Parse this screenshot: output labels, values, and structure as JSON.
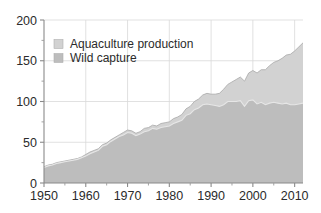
{
  "chart_data": {
    "type": "area",
    "title": "",
    "subtitle": "",
    "xlabel": "",
    "ylabel": "",
    "xlim": [
      1950,
      2012
    ],
    "ylim": [
      0,
      200
    ],
    "grid": true,
    "stacked": true,
    "legend_position": "top-left",
    "x": [
      1950,
      1951,
      1952,
      1953,
      1954,
      1955,
      1956,
      1957,
      1958,
      1959,
      1960,
      1961,
      1962,
      1963,
      1964,
      1965,
      1966,
      1967,
      1968,
      1969,
      1970,
      1971,
      1972,
      1973,
      1974,
      1975,
      1976,
      1977,
      1978,
      1979,
      1980,
      1981,
      1982,
      1983,
      1984,
      1985,
      1986,
      1987,
      1988,
      1989,
      1990,
      1991,
      1992,
      1993,
      1994,
      1995,
      1996,
      1997,
      1998,
      1999,
      2000,
      2001,
      2002,
      2003,
      2004,
      2005,
      2006,
      2007,
      2008,
      2009,
      2010,
      2011,
      2012
    ],
    "xticks": [
      1950,
      1960,
      1970,
      1980,
      1990,
      2000,
      2010
    ],
    "yticks": [
      0,
      50,
      100,
      150,
      200
    ],
    "yticks_minor": [
      25,
      75,
      125,
      175
    ],
    "series": [
      {
        "name": "Wild capture",
        "color": "#bdbdbd",
        "values": [
          19,
          21,
          22,
          24,
          25,
          26,
          27,
          28,
          29,
          31,
          33,
          36,
          38,
          40,
          45,
          47,
          51,
          54,
          57,
          59,
          62,
          61,
          58,
          60,
          63,
          64,
          67,
          66,
          68,
          69,
          70,
          73,
          75,
          77,
          83,
          85,
          90,
          92,
          96,
          97,
          96,
          95,
          94,
          96,
          100,
          100,
          100,
          101,
          94,
          101,
          102,
          97,
          99,
          96,
          98,
          99,
          98,
          97,
          98,
          96,
          96,
          97,
          98
        ]
      },
      {
        "name": "Aquaculture production",
        "color": "#d2d2d2",
        "values": [
          1,
          1,
          1,
          1,
          1,
          1,
          1,
          1,
          1,
          1,
          2,
          2,
          2,
          2,
          2,
          2,
          2,
          2,
          2,
          3,
          3,
          3,
          3,
          3,
          4,
          4,
          4,
          4,
          5,
          5,
          5,
          6,
          6,
          7,
          8,
          9,
          10,
          11,
          12,
          13,
          13,
          14,
          16,
          19,
          21,
          24,
          27,
          29,
          31,
          34,
          36,
          38,
          40,
          43,
          46,
          49,
          52,
          56,
          59,
          62,
          66,
          70,
          74
        ]
      }
    ],
    "legend": [
      {
        "label": "Aquaculture production",
        "color": "#d2d2d2",
        "swatch": "square-swatch"
      },
      {
        "label": "Wild capture",
        "color": "#bdbdbd",
        "swatch": "square-swatch"
      }
    ]
  }
}
